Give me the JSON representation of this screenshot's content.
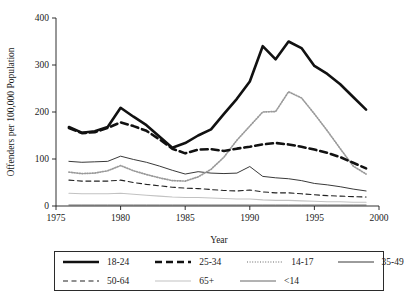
{
  "chart_data": {
    "type": "line",
    "title": "",
    "xlabel": "Year",
    "ylabel": "Offenders per 100,000 Population",
    "xlim": [
      1975,
      2000
    ],
    "ylim": [
      0,
      400
    ],
    "xticks": [
      1975,
      1980,
      1985,
      1990,
      1995,
      2000
    ],
    "xticklabels": [
      "1975",
      "1980",
      "1985",
      "1990",
      "1995",
      "2000"
    ],
    "yticks": [
      0,
      100,
      200,
      300,
      400
    ],
    "yticklabels": [
      "0",
      "100",
      "200",
      "300",
      "400"
    ],
    "grid": false,
    "legend_position": "below",
    "x": [
      1976,
      1977,
      1978,
      1979,
      1980,
      1981,
      1982,
      1983,
      1984,
      1985,
      1986,
      1987,
      1988,
      1989,
      1990,
      1991,
      1992,
      1993,
      1994,
      1995,
      1996,
      1997,
      1998,
      1999
    ],
    "series": [
      {
        "name": "18-24",
        "style": "thick-solid",
        "color": "#111111",
        "width": 2.6,
        "dash": "",
        "values": [
          168,
          156,
          159,
          168,
          209,
          190,
          172,
          148,
          124,
          134,
          150,
          163,
          196,
          228,
          265,
          340,
          312,
          350,
          336,
          298,
          281,
          259,
          232,
          205
        ]
      },
      {
        "name": "25-34",
        "style": "thick-dashed",
        "color": "#111111",
        "width": 2.6,
        "dash": "7,4",
        "values": [
          166,
          155,
          157,
          166,
          178,
          170,
          160,
          142,
          122,
          112,
          120,
          121,
          117,
          122,
          126,
          131,
          134,
          131,
          126,
          120,
          113,
          104,
          92,
          80
        ]
      },
      {
        "name": "14-17",
        "style": "dotted",
        "color": "#9a9a9a",
        "width": 1.7,
        "dash": "1,1.6",
        "values": [
          72,
          69,
          70,
          75,
          86,
          75,
          67,
          60,
          54,
          53,
          62,
          78,
          104,
          140,
          170,
          200,
          201,
          243,
          230,
          196,
          160,
          122,
          85,
          68
        ]
      },
      {
        "name": "35-49",
        "style": "thin-solid",
        "color": "#222222",
        "width": 0.9,
        "dash": "",
        "values": [
          95,
          93,
          94,
          95,
          106,
          99,
          93,
          85,
          76,
          68,
          73,
          70,
          69,
          70,
          84,
          63,
          60,
          58,
          54,
          48,
          45,
          41,
          36,
          32
        ]
      },
      {
        "name": "50-64",
        "style": "dashed",
        "color": "#222222",
        "width": 1.1,
        "dash": "5,3.5",
        "values": [
          55,
          53,
          53,
          53,
          55,
          50,
          46,
          43,
          40,
          38,
          37,
          35,
          33,
          32,
          34,
          30,
          28,
          28,
          26,
          24,
          22,
          21,
          20,
          19
        ]
      },
      {
        "name": "65+",
        "style": "light-solid",
        "color": "#c2c2c2",
        "width": 1.1,
        "dash": "",
        "values": [
          27,
          26,
          26,
          26,
          27,
          25,
          23,
          21,
          19,
          18,
          18,
          17,
          16,
          15,
          15,
          13,
          12,
          12,
          11,
          10,
          9,
          9,
          8,
          8
        ]
      },
      {
        "name": "<14",
        "style": "thin-solid",
        "color": "#555555",
        "width": 0.9,
        "dash": "",
        "values": [
          2,
          2,
          2,
          2,
          2,
          2,
          2,
          2,
          2,
          2,
          2,
          2,
          2,
          2,
          2,
          2,
          2,
          2,
          2,
          2,
          2,
          2,
          2,
          2
        ]
      }
    ]
  },
  "legend": {
    "rows": [
      [
        {
          "label": "18-24",
          "series": 0
        },
        {
          "label": "25-34",
          "series": 1
        },
        {
          "label": "14-17",
          "series": 2
        },
        {
          "label": "35-49",
          "series": 3
        }
      ],
      [
        {
          "label": "50-64",
          "series": 4
        },
        {
          "label": "65+",
          "series": 5
        },
        {
          "label": "<14",
          "series": 6
        }
      ]
    ]
  }
}
